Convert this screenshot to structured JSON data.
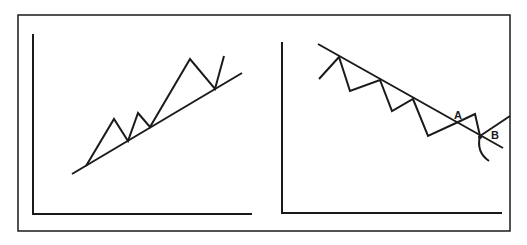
{
  "figure": {
    "frame": {
      "x": 18,
      "y": 15,
      "w": 492,
      "h": 216
    },
    "panels": [
      {
        "id": "uptrend",
        "axes": {
          "x0": 33,
          "y_top": 34,
          "y_bottom": 214,
          "x_right": 252
        },
        "trendline": [
          [
            72,
            174
          ],
          [
            242,
            73
          ]
        ],
        "price_path": [
          [
            86,
            166
          ],
          [
            114,
            119
          ],
          [
            128,
            141
          ],
          [
            138,
            113
          ],
          [
            150,
            127
          ],
          [
            190,
            59
          ],
          [
            215,
            89
          ],
          [
            224,
            56
          ]
        ],
        "labels": []
      },
      {
        "id": "downtrend",
        "axes": {
          "x0": 282,
          "y_top": 42,
          "y_bottom": 213,
          "x_right": 502
        },
        "trendline": [
          [
            318,
            44
          ],
          [
            503,
            148
          ]
        ],
        "price_path": [
          [
            319,
            79
          ],
          [
            339,
            57
          ],
          [
            350,
            91
          ],
          [
            380,
            80
          ],
          [
            392,
            111
          ],
          [
            413,
            99
          ],
          [
            428,
            136
          ],
          [
            456,
            123
          ],
          [
            475,
            114
          ],
          [
            480,
            136
          ]
        ],
        "breakout_line": [
          [
            480,
            136
          ],
          [
            510,
            116
          ]
        ],
        "curve": "M480,136 Q476,152 489,161",
        "labels": [
          {
            "text": "A",
            "x": 454,
            "y": 119
          },
          {
            "text": "B",
            "x": 491,
            "y": 139
          }
        ]
      }
    ]
  }
}
